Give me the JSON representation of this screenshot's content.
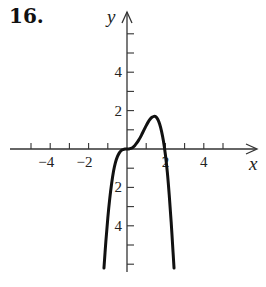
{
  "problem_number": "16.",
  "chart_data": {
    "type": "line",
    "title": "",
    "xlabel": "x",
    "ylabel": "y",
    "xlim": [
      -5.8,
      6.2
    ],
    "ylim": [
      -6.3,
      6.5
    ],
    "grid": false,
    "legend": null,
    "x_tick_labels": [
      "−4",
      "−2",
      "2",
      "4"
    ],
    "x_tick_values": [
      -4,
      -2,
      2,
      4
    ],
    "y_tick_labels": [
      "4",
      "2",
      "2",
      "4"
    ],
    "y_tick_values": [
      4,
      2,
      -2,
      -4
    ],
    "x_minor_ticks": [
      -5,
      -4,
      -3,
      -2,
      -1,
      1,
      2,
      3,
      4,
      5
    ],
    "y_minor_ticks": [
      -6,
      -5,
      -4,
      -3,
      -2,
      -1,
      1,
      2,
      3,
      4,
      5,
      6
    ],
    "series": [
      {
        "name": "f(x)",
        "color": "#111111",
        "points": [
          [
            -1.2,
            -6.2
          ],
          [
            -1.1,
            -4.8
          ],
          [
            -1.0,
            -3.6
          ],
          [
            -0.9,
            -2.6
          ],
          [
            -0.8,
            -1.8
          ],
          [
            -0.7,
            -1.15
          ],
          [
            -0.6,
            -0.7
          ],
          [
            -0.5,
            -0.4
          ],
          [
            -0.4,
            -0.2
          ],
          [
            -0.3,
            -0.08
          ],
          [
            -0.2,
            -0.03
          ],
          [
            -0.1,
            -0.005
          ],
          [
            0.0,
            0.0
          ],
          [
            0.1,
            0.005
          ],
          [
            0.2,
            0.03
          ],
          [
            0.3,
            0.08
          ],
          [
            0.4,
            0.17
          ],
          [
            0.5,
            0.3
          ],
          [
            0.6,
            0.45
          ],
          [
            0.7,
            0.62
          ],
          [
            0.8,
            0.82
          ],
          [
            0.9,
            1.02
          ],
          [
            1.0,
            1.22
          ],
          [
            1.1,
            1.4
          ],
          [
            1.2,
            1.55
          ],
          [
            1.3,
            1.65
          ],
          [
            1.4,
            1.7
          ],
          [
            1.5,
            1.68
          ],
          [
            1.6,
            1.55
          ],
          [
            1.7,
            1.3
          ],
          [
            1.8,
            0.92
          ],
          [
            1.9,
            0.4
          ],
          [
            2.0,
            -0.3
          ],
          [
            2.1,
            -1.2
          ],
          [
            2.2,
            -2.4
          ],
          [
            2.3,
            -3.8
          ],
          [
            2.4,
            -5.4
          ],
          [
            2.45,
            -6.2
          ]
        ]
      }
    ]
  }
}
